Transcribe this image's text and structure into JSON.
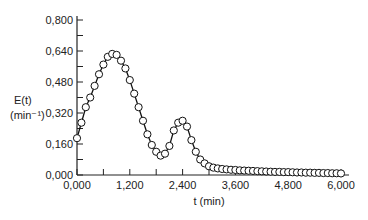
{
  "chart_data": {
    "type": "line",
    "title": "",
    "xlabel": "t (min)",
    "ylabel": "E(t) (min⁻¹)",
    "ylabel_line1": "E(t)",
    "ylabel_line2": "(min⁻¹)",
    "xlim": [
      0,
      6000
    ],
    "ylim": [
      0,
      0.8
    ],
    "xticks": [
      "0,000",
      "1,200",
      "2,400",
      "3,600",
      "4,800",
      "6,000"
    ],
    "yticks": [
      "0,000",
      "0,160",
      "0,320",
      "0,480",
      "0,640",
      "0,800"
    ],
    "grid": false,
    "legend": null,
    "marker": "open-circle",
    "series": [
      {
        "name": "E(t)",
        "x": [
          0,
          100,
          200,
          300,
          400,
          500,
          600,
          700,
          800,
          900,
          1000,
          1100,
          1200,
          1300,
          1400,
          1500,
          1600,
          1700,
          1800,
          1900,
          2000,
          2100,
          2200,
          2300,
          2400,
          2500,
          2600,
          2700,
          2800,
          2900,
          3000,
          3100,
          3200,
          3300,
          3400,
          3500,
          3600,
          3700,
          3800,
          3900,
          4000,
          4100,
          4200,
          4300,
          4400,
          4500,
          4600,
          4700,
          4800,
          4900,
          5000,
          5100,
          5200,
          5300,
          5400,
          5500,
          5600,
          5700,
          5800,
          5900,
          6000
        ],
        "y": [
          0.19,
          0.27,
          0.35,
          0.4,
          0.46,
          0.52,
          0.57,
          0.61,
          0.625,
          0.62,
          0.59,
          0.55,
          0.49,
          0.42,
          0.35,
          0.28,
          0.21,
          0.155,
          0.12,
          0.1,
          0.11,
          0.15,
          0.23,
          0.27,
          0.28,
          0.25,
          0.18,
          0.12,
          0.08,
          0.06,
          0.045,
          0.038,
          0.034,
          0.031,
          0.029,
          0.027,
          0.026,
          0.024,
          0.023,
          0.022,
          0.021,
          0.02,
          0.019,
          0.018,
          0.017,
          0.016,
          0.016,
          0.015,
          0.015,
          0.014,
          0.013,
          0.013,
          0.012,
          0.012,
          0.011,
          0.011,
          0.01,
          0.01,
          0.009,
          0.009,
          0.008
        ]
      }
    ]
  }
}
